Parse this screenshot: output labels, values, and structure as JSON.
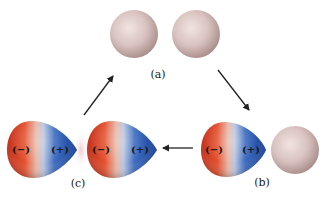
{
  "diagram": {
    "type": "induced-dipole interaction cycle",
    "stages": [
      {
        "id": "a",
        "label": "(a)",
        "description": "two neutral non-polar atoms"
      },
      {
        "id": "b",
        "label": "(b)",
        "description": "instantaneous dipole next to neutral atom",
        "dipole_signs": [
          "(−)",
          "(+)"
        ]
      },
      {
        "id": "c",
        "label": "(c)",
        "description": "induced dipole pair attraction",
        "dipole_signs": [
          [
            "(−)",
            "(+)"
          ],
          [
            "(−)",
            "(+)"
          ]
        ]
      }
    ],
    "arrows": [
      {
        "from": "a",
        "to": "b",
        "direction": "down-right"
      },
      {
        "from": "b",
        "to": "c",
        "direction": "left"
      },
      {
        "from": "c",
        "to": "a",
        "direction": "up-right"
      }
    ],
    "colors": {
      "neutral_atom": "#d9c3c0",
      "negative_pole": "#e0442c",
      "positive_pole": "#1f4fa8",
      "arrow": "#222222"
    }
  }
}
